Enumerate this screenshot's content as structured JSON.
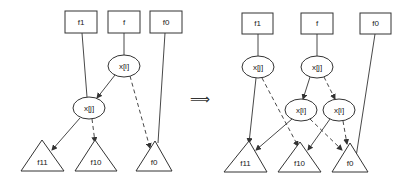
{
  "diagram": {
    "transform_symbol": "⟹",
    "left": {
      "boxes": [
        {
          "id": "f1",
          "label": "f1",
          "x": 65,
          "y": 11,
          "w": 32,
          "h": 22
        },
        {
          "id": "f",
          "label": "f",
          "x": 108,
          "y": 11,
          "w": 32,
          "h": 22
        },
        {
          "id": "f0",
          "label": "f0",
          "x": 150,
          "y": 11,
          "w": 32,
          "h": 22
        }
      ],
      "ovals": [
        {
          "id": "xi",
          "label": "x[i]",
          "cx": 124,
          "cy": 66,
          "rx": 16,
          "ry": 11
        },
        {
          "id": "xj",
          "label": "x[j]",
          "cx": 89,
          "cy": 108,
          "rx": 16,
          "ry": 11
        }
      ],
      "triangles": [
        {
          "id": "f11",
          "label": "f11",
          "ax": 42,
          "ay": 140,
          "bx1": 21,
          "bx2": 64,
          "by": 171
        },
        {
          "id": "f10",
          "label": "f10",
          "ax": 95,
          "ay": 140,
          "bx1": 75,
          "bx2": 117,
          "by": 171
        },
        {
          "id": "f0t",
          "label": "f0",
          "ax": 155,
          "ay": 141,
          "bx1": 136,
          "bx2": 172,
          "by": 171
        }
      ],
      "edges": [
        {
          "from": "f-box",
          "x1": 124,
          "y1": 33,
          "x2": 124,
          "y2": 55,
          "style": "solid",
          "arrow": false
        },
        {
          "from": "f1-box",
          "x1": 82,
          "y1": 33,
          "x2": 87,
          "y2": 97,
          "style": "solid",
          "arrow": false
        },
        {
          "from": "xi-solid",
          "x1": 115,
          "y1": 75,
          "x2": 97,
          "y2": 98,
          "style": "solid",
          "arrow": true
        },
        {
          "from": "xi-dashed",
          "x1": 130,
          "y1": 76,
          "x2": 150,
          "y2": 148,
          "style": "dashed",
          "arrow": true
        },
        {
          "from": "f0-box",
          "x1": 165,
          "y1": 33,
          "x2": 158,
          "y2": 143,
          "style": "solid",
          "arrow": false
        },
        {
          "from": "xj-solid",
          "x1": 80,
          "y1": 118,
          "x2": 52,
          "y2": 150,
          "style": "solid",
          "arrow": true
        },
        {
          "from": "xj-dashed",
          "x1": 92,
          "y1": 119,
          "x2": 95,
          "y2": 142,
          "style": "dashed",
          "arrow": true
        }
      ]
    },
    "right": {
      "boxes": [
        {
          "id": "f1",
          "label": "f1",
          "x": 242,
          "y": 13,
          "w": 31,
          "h": 21
        },
        {
          "id": "f",
          "label": "f",
          "x": 301,
          "y": 13,
          "w": 32,
          "h": 21
        },
        {
          "id": "f0",
          "label": "f0",
          "x": 360,
          "y": 13,
          "w": 31,
          "h": 21
        }
      ],
      "ovals": [
        {
          "id": "xj1",
          "label": "x[j]",
          "cx": 258,
          "cy": 67,
          "rx": 16,
          "ry": 11
        },
        {
          "id": "xj2",
          "label": "x[j]",
          "cx": 317,
          "cy": 67,
          "rx": 16,
          "ry": 11
        },
        {
          "id": "xi1",
          "label": "x[i]",
          "cx": 301,
          "cy": 110,
          "rx": 16,
          "ry": 11
        },
        {
          "id": "xi2",
          "label": "x[i]",
          "cx": 339,
          "cy": 110,
          "rx": 16,
          "ry": 11
        }
      ],
      "triangles": [
        {
          "id": "f11",
          "label": "f11",
          "ax": 249,
          "ay": 141,
          "bx1": 224,
          "bx2": 267,
          "by": 172
        },
        {
          "id": "f10",
          "label": "f10",
          "ax": 300,
          "ay": 142,
          "bx1": 278,
          "bx2": 321,
          "by": 172
        },
        {
          "id": "f0t",
          "label": "f0",
          "ax": 350,
          "ay": 143,
          "bx1": 332,
          "bx2": 368,
          "by": 172
        }
      ],
      "edges": [
        {
          "from": "f1-box",
          "x1": 258,
          "y1": 34,
          "x2": 258,
          "y2": 56,
          "style": "solid",
          "arrow": false
        },
        {
          "from": "f-box",
          "x1": 317,
          "y1": 34,
          "x2": 317,
          "y2": 56,
          "style": "solid",
          "arrow": false
        },
        {
          "from": "f0-box",
          "x1": 375,
          "y1": 34,
          "x2": 356,
          "y2": 157,
          "style": "solid",
          "arrow": false
        },
        {
          "from": "xj1-solid",
          "x1": 256,
          "y1": 78,
          "x2": 249,
          "y2": 143,
          "style": "solid",
          "arrow": true
        },
        {
          "from": "xj1-dashed",
          "x1": 262,
          "y1": 78,
          "x2": 298,
          "y2": 146,
          "style": "dashed",
          "arrow": true
        },
        {
          "from": "xj2-solid",
          "x1": 310,
          "y1": 77,
          "x2": 303,
          "y2": 99,
          "style": "solid",
          "arrow": true
        },
        {
          "from": "xj2-dashed",
          "x1": 324,
          "y1": 77,
          "x2": 335,
          "y2": 99,
          "style": "dashed",
          "arrow": true
        },
        {
          "from": "xi1-solid",
          "x1": 292,
          "y1": 119,
          "x2": 256,
          "y2": 150,
          "style": "solid",
          "arrow": true
        },
        {
          "from": "xi1-dashed",
          "x1": 310,
          "y1": 119,
          "x2": 342,
          "y2": 150,
          "style": "dashed",
          "arrow": true
        },
        {
          "from": "xi2-solid",
          "x1": 330,
          "y1": 119,
          "x2": 308,
          "y2": 150,
          "style": "solid",
          "arrow": true
        },
        {
          "from": "xi2-dashed",
          "x1": 343,
          "y1": 121,
          "x2": 347,
          "y2": 144,
          "style": "dashed",
          "arrow": true
        }
      ]
    }
  }
}
